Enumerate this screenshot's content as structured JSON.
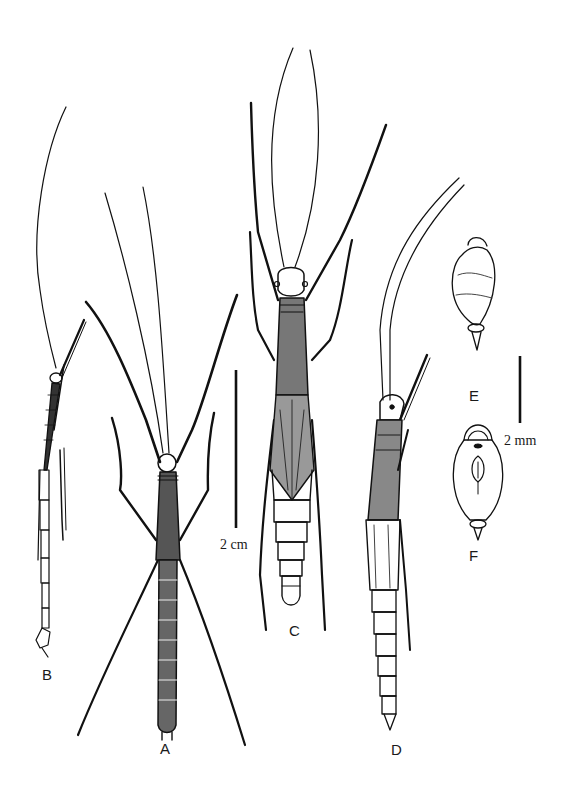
{
  "figure": {
    "type": "scientific illustration plate",
    "panels": [
      {
        "id": "A",
        "label": "A",
        "description": "dorsal habitus, legs spread"
      },
      {
        "id": "B",
        "label": "B",
        "description": "lateral habitus, slender specimen"
      },
      {
        "id": "C",
        "label": "C",
        "description": "dorsal habitus, winged specimen"
      },
      {
        "id": "D",
        "label": "D",
        "description": "lateral habitus"
      },
      {
        "id": "E",
        "label": "E",
        "description": "egg, lateral view"
      },
      {
        "id": "F",
        "label": "F",
        "description": "egg, dorsal view with micropylar plate"
      }
    ],
    "scale_bars": [
      {
        "id": "large",
        "label": "2 cm",
        "applies_to": [
          "A",
          "B",
          "C",
          "D"
        ]
      },
      {
        "id": "small",
        "label": "2 mm",
        "applies_to": [
          "E",
          "F"
        ]
      }
    ],
    "colors": {
      "ink": "#111111",
      "background": "#ffffff"
    }
  }
}
